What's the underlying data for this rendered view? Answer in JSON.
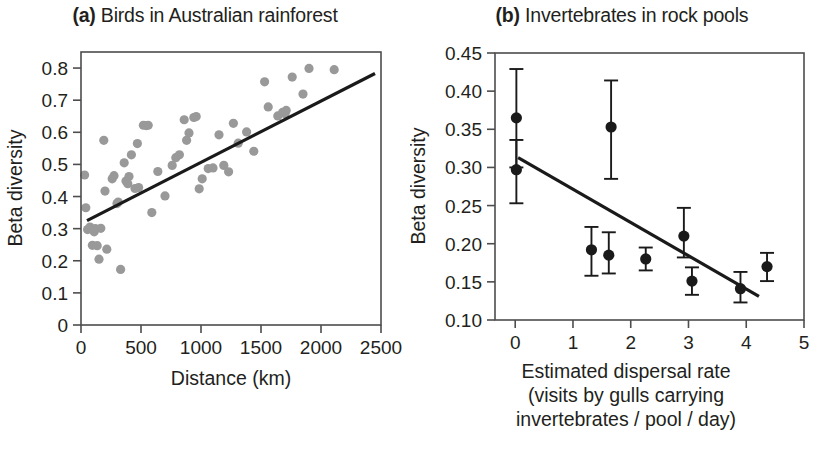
{
  "figure": {
    "background": "#ffffff",
    "ink_color": "#231f20",
    "scatter_color": "#999999",
    "point_color": "#1a1a1a",
    "line_color": "#1a1a1a"
  },
  "panel_a": {
    "tag": "(a)",
    "title": "Birds in Australian rainforest",
    "ylabel": "Beta diversity",
    "xlabel": "Distance (km)"
  },
  "panel_b": {
    "tag": "(b)",
    "title": "Invertebrates in rock pools",
    "ylabel": "Beta diversity",
    "xlabel_line1": "Estimated dispersal rate",
    "xlabel_line2": "(visits by gulls carrying",
    "xlabel_line3": "invertebrates / pool / day)"
  },
  "chart_data": [
    {
      "type": "scatter",
      "id": "panel-a",
      "title": "(a) Birds in Australian rainforest",
      "xlabel": "Distance (km)",
      "ylabel": "Beta diversity",
      "xlim": [
        0,
        2500
      ],
      "ylim": [
        0,
        0.85
      ],
      "xticks": [
        0,
        500,
        1000,
        1500,
        2000,
        2500
      ],
      "xtick_labels": [
        "0",
        "500",
        "1000",
        "1500",
        "2000",
        "2500"
      ],
      "yticks": [
        0,
        0.1,
        0.2,
        0.3,
        0.4,
        0.5,
        0.6,
        0.7,
        0.8
      ],
      "ytick_labels": [
        "0",
        "0.1",
        "0.2",
        "0.3",
        "0.4",
        "0.5",
        "0.6",
        "0.7",
        "0.8"
      ],
      "grid": false,
      "legend": "none",
      "marker": "filled-circle-gray",
      "points": [
        [
          30,
          0.467
        ],
        [
          40,
          0.365
        ],
        [
          55,
          0.297
        ],
        [
          75,
          0.305
        ],
        [
          95,
          0.248
        ],
        [
          110,
          0.29
        ],
        [
          120,
          0.3
        ],
        [
          135,
          0.247
        ],
        [
          150,
          0.205
        ],
        [
          165,
          0.301
        ],
        [
          190,
          0.575
        ],
        [
          200,
          0.417
        ],
        [
          215,
          0.236
        ],
        [
          260,
          0.455
        ],
        [
          275,
          0.465
        ],
        [
          300,
          0.378
        ],
        [
          310,
          0.383
        ],
        [
          330,
          0.173
        ],
        [
          360,
          0.505
        ],
        [
          375,
          0.448
        ],
        [
          390,
          0.44
        ],
        [
          400,
          0.462
        ],
        [
          420,
          0.53
        ],
        [
          450,
          0.425
        ],
        [
          470,
          0.565
        ],
        [
          480,
          0.428
        ],
        [
          520,
          0.622
        ],
        [
          545,
          0.621
        ],
        [
          560,
          0.622
        ],
        [
          590,
          0.35
        ],
        [
          640,
          0.478
        ],
        [
          700,
          0.402
        ],
        [
          760,
          0.497
        ],
        [
          790,
          0.521
        ],
        [
          820,
          0.53
        ],
        [
          860,
          0.639
        ],
        [
          880,
          0.575
        ],
        [
          900,
          0.598
        ],
        [
          940,
          0.646
        ],
        [
          960,
          0.649
        ],
        [
          985,
          0.424
        ],
        [
          1010,
          0.455
        ],
        [
          1060,
          0.487
        ],
        [
          1100,
          0.489
        ],
        [
          1150,
          0.592
        ],
        [
          1190,
          0.497
        ],
        [
          1230,
          0.477
        ],
        [
          1270,
          0.628
        ],
        [
          1310,
          0.566
        ],
        [
          1380,
          0.601
        ],
        [
          1440,
          0.541
        ],
        [
          1530,
          0.757
        ],
        [
          1560,
          0.679
        ],
        [
          1640,
          0.651
        ],
        [
          1680,
          0.662
        ],
        [
          1700,
          0.658
        ],
        [
          1710,
          0.668
        ],
        [
          1760,
          0.772
        ],
        [
          1850,
          0.719
        ],
        [
          1900,
          0.799
        ],
        [
          2110,
          0.795
        ]
      ],
      "trendline": {
        "x0": 50,
        "y0": 0.325,
        "x1": 2450,
        "y1": 0.783
      }
    },
    {
      "type": "scatter-errorbar",
      "id": "panel-b",
      "title": "(b) Invertebrates in rock pools",
      "xlabel": "Estimated dispersal rate (visits by gulls carrying invertebrates / pool / day)",
      "ylabel": "Beta diversity",
      "xlim": [
        -0.35,
        5
      ],
      "ylim": [
        0.1,
        0.45
      ],
      "xticks": [
        0,
        1,
        2,
        3,
        4,
        5
      ],
      "xtick_labels": [
        "0",
        "1",
        "2",
        "3",
        "4",
        "5"
      ],
      "yticks": [
        0.1,
        0.15,
        0.2,
        0.25,
        0.3,
        0.35,
        0.4,
        0.45
      ],
      "ytick_labels": [
        "0.10",
        "0.15",
        "0.20",
        "0.25",
        "0.30",
        "0.35",
        "0.40",
        "0.45"
      ],
      "grid": false,
      "legend": "none",
      "marker": "filled-circle-black",
      "points": [
        {
          "x": 0.02,
          "y": 0.365,
          "lo": 0.3,
          "hi": 0.429
        },
        {
          "x": 0.02,
          "y": 0.297,
          "lo": 0.253,
          "hi": 0.336
        },
        {
          "x": 1.32,
          "y": 0.192,
          "lo": 0.158,
          "hi": 0.222
        },
        {
          "x": 1.62,
          "y": 0.185,
          "lo": 0.161,
          "hi": 0.215
        },
        {
          "x": 1.66,
          "y": 0.353,
          "lo": 0.285,
          "hi": 0.414
        },
        {
          "x": 2.26,
          "y": 0.18,
          "lo": 0.165,
          "hi": 0.195
        },
        {
          "x": 2.92,
          "y": 0.21,
          "lo": 0.182,
          "hi": 0.247
        },
        {
          "x": 3.06,
          "y": 0.151,
          "lo": 0.133,
          "hi": 0.169
        },
        {
          "x": 3.9,
          "y": 0.141,
          "lo": 0.123,
          "hi": 0.163
        },
        {
          "x": 4.36,
          "y": 0.17,
          "lo": 0.151,
          "hi": 0.188
        }
      ],
      "trendline": {
        "x0": 0.05,
        "y0": 0.313,
        "x1": 4.22,
        "y1": 0.131
      }
    }
  ]
}
